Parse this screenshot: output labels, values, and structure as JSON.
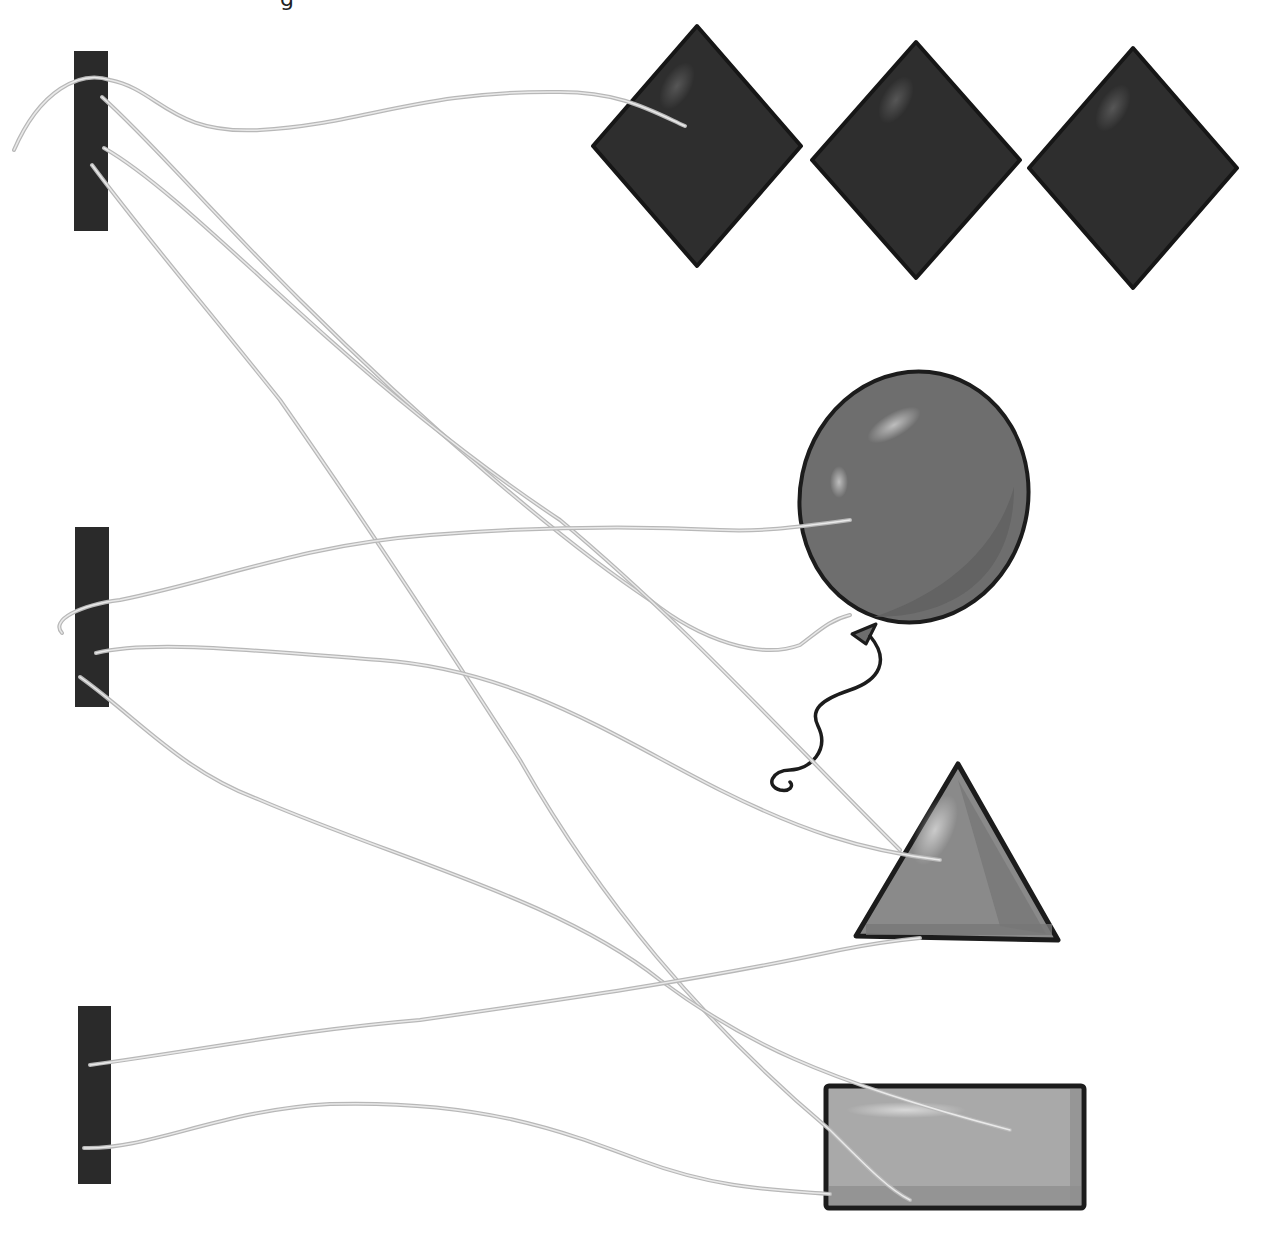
{
  "canvas": {
    "width": 1264,
    "height": 1242,
    "background": "#ffffff"
  },
  "title_fragment": "g",
  "colors": {
    "bar": "#2a2a2a",
    "diamond_fill": "#2e2e2e",
    "diamond_stroke": "#161616",
    "balloon_fill": "#6e6e6e",
    "balloon_shade": "#5e5e5e",
    "triangle_fill": "#8a8a8a",
    "triangle_shade": "#777777",
    "rect_fill": "#a9a9a9",
    "rect_shade": "#8f8f8f",
    "outline": "#1c1c1c",
    "string": "#b8b8b8",
    "string_core": "#e9e9e9"
  },
  "bars": [
    {
      "id": "bar-1",
      "x": 74,
      "y": 51,
      "w": 34,
      "h": 180
    },
    {
      "id": "bar-2",
      "x": 75,
      "y": 527,
      "w": 34,
      "h": 180
    },
    {
      "id": "bar-3",
      "x": 78,
      "y": 1006,
      "w": 33,
      "h": 178
    }
  ],
  "objects": [
    {
      "id": "diamond-1",
      "type": "diamond",
      "cx": 697,
      "cy": 146,
      "rx": 104,
      "ry": 120
    },
    {
      "id": "diamond-2",
      "type": "diamond",
      "cx": 916,
      "cy": 160,
      "rx": 104,
      "ry": 118
    },
    {
      "id": "diamond-3",
      "type": "diamond",
      "cx": 1133,
      "cy": 168,
      "rx": 104,
      "ry": 120
    },
    {
      "id": "balloon",
      "type": "balloon",
      "cx": 914,
      "cy": 497,
      "rx": 114,
      "ry": 126
    },
    {
      "id": "triangle",
      "type": "triangle",
      "points": "958,764 1058,940 856,936"
    },
    {
      "id": "rectangle",
      "type": "rectangle",
      "x": 826,
      "y": 1086,
      "w": 258,
      "h": 122
    }
  ],
  "strings": [
    {
      "from": "bar-1",
      "to": "diamond-1",
      "d": "M14,150 C40,90 80,70 110,80 C160,90 170,135 260,130 C360,125 420,90 560,92 C620,92 650,110 685,126"
    },
    {
      "from": "bar-1",
      "to": "balloon",
      "d": "M102,97 C150,140 200,200 300,300 C420,420 560,540 650,600 C700,640 760,660 800,645 C820,630 830,620 850,615"
    },
    {
      "from": "bar-1",
      "to": "triangle",
      "d": "M104,148 C160,180 240,260 330,340 C420,420 500,480 560,520 C680,620 780,730 900,850"
    },
    {
      "from": "bar-1",
      "to": "rectangle",
      "d": "M92,165 C140,230 200,300 280,400 C350,500 430,620 520,760 C600,900 700,1020 830,1130 C870,1170 890,1190 910,1200"
    },
    {
      "from": "bar-2",
      "to": "balloon",
      "d": "M62,633 C50,620 80,605 120,600 C220,580 300,545 430,535 C520,528 620,525 720,530 C760,532 790,528 850,520"
    },
    {
      "from": "bar-2",
      "to": "triangle",
      "d": "M96,653 C150,640 250,650 380,660 C520,670 620,740 720,790 C800,830 860,850 940,860"
    },
    {
      "from": "bar-2",
      "to": "rectangle",
      "d": "M80,677 C140,720 180,770 260,800 C400,860 560,900 660,980 C740,1040 820,1080 1010,1130"
    },
    {
      "from": "bar-3",
      "to": "triangle",
      "d": "M90,1065 C200,1050 300,1030 420,1020 C560,1000 700,980 840,950 C880,942 900,940 920,938"
    },
    {
      "from": "bar-3",
      "to": "rectangle",
      "d": "M84,1148 C150,1150 220,1110 330,1104 C480,1100 560,1130 640,1160 C720,1190 780,1190 830,1194"
    }
  ],
  "balloon_tail": {
    "knot": "852,634 876,624 866,644",
    "ribbon": "M870,636 C890,660 880,680 850,690 C820,700 810,710 818,726 C830,750 810,770 790,770 C772,770 765,786 780,790 C790,792 794,786 790,782"
  }
}
